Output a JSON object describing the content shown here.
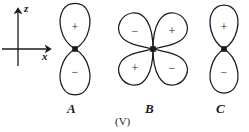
{
  "figure": {
    "caption": "(V)",
    "background_color": "#ffffff",
    "ink_color": "#1a1a1a",
    "width": 249,
    "height": 132
  },
  "axes": {
    "name": "coordinate-axes",
    "vertical": {
      "label": "z",
      "origin": {
        "x": 18,
        "y": 49
      },
      "tip": {
        "x": 18,
        "y": 8
      },
      "tail": {
        "x": 18,
        "y": 66
      },
      "label_pos": {
        "x": 24,
        "y": 4
      }
    },
    "horizontal": {
      "label": "x",
      "origin": {
        "x": 18,
        "y": 49
      },
      "tip": {
        "x": 51,
        "y": 49
      },
      "tail": {
        "x": 2,
        "y": 49
      },
      "label_pos": {
        "x": 42,
        "y": 52
      }
    }
  },
  "orbitals": [
    {
      "id": "A",
      "label": "A",
      "type": "p-orbital-vertical",
      "center": {
        "x": 75,
        "y": 49
      },
      "label_pos": {
        "x": 70,
        "y": 104
      },
      "lobes": [
        {
          "name": "upper-lobe",
          "sign": "+",
          "sign_pos": {
            "x": 75,
            "y": 27
          }
        },
        {
          "name": "lower-lobe",
          "sign": "−",
          "sign_pos": {
            "x": 75,
            "y": 72
          }
        }
      ]
    },
    {
      "id": "B",
      "label": "B",
      "type": "d-orbital-four-lobe",
      "center": {
        "x": 153,
        "y": 49
      },
      "label_pos": {
        "x": 148,
        "y": 104
      },
      "lobes": [
        {
          "name": "upper-left-lobe",
          "sign": "−",
          "sign_pos": {
            "x": 135,
            "y": 31
          }
        },
        {
          "name": "upper-right-lobe",
          "sign": "+",
          "sign_pos": {
            "x": 172,
            "y": 31
          }
        },
        {
          "name": "lower-left-lobe",
          "sign": "+",
          "sign_pos": {
            "x": 135,
            "y": 68
          }
        },
        {
          "name": "lower-right-lobe",
          "sign": "−",
          "sign_pos": {
            "x": 172,
            "y": 68
          }
        }
      ]
    },
    {
      "id": "C",
      "label": "C",
      "type": "p-orbital-vertical",
      "center": {
        "x": 224,
        "y": 49
      },
      "label_pos": {
        "x": 219,
        "y": 104
      },
      "lobes": [
        {
          "name": "upper-lobe",
          "sign": "+",
          "sign_pos": {
            "x": 224,
            "y": 27
          }
        },
        {
          "name": "lower-lobe",
          "sign": "−",
          "sign_pos": {
            "x": 224,
            "y": 72
          }
        }
      ]
    }
  ],
  "caption": {
    "text": "(V)",
    "pos": {
      "x": 125,
      "y": 118
    }
  }
}
